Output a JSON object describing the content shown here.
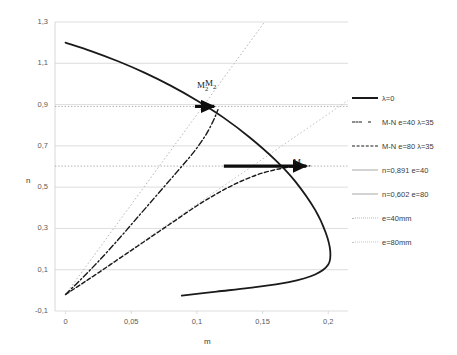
{
  "chart_data": {
    "type": "line",
    "title": "",
    "xlabel": "m",
    "ylabel": "n",
    "xlim": [
      -0.008,
      0.215
    ],
    "ylim": [
      -0.1,
      1.3
    ],
    "grid": true,
    "legend_position": "right",
    "x_ticks": [
      "0",
      "0,05",
      "0,1",
      "0,15",
      "0,2"
    ],
    "x_tick_values": [
      0,
      0.05,
      0.1,
      0.15,
      0.2
    ],
    "y_ticks": [
      "-0,1",
      "0,1",
      "0,3",
      "0,5",
      "0,7",
      "0,9",
      "1,1",
      "1,3"
    ],
    "y_tick_values": [
      -0.1,
      0.1,
      0.3,
      0.5,
      0.7,
      0.9,
      1.1,
      1.3
    ],
    "series": [
      {
        "name": "λ=0",
        "style": "solid",
        "color": "#1a1a1a",
        "width": 1.8,
        "points": [
          [
            0.0,
            1.2
          ],
          [
            0.02,
            1.158
          ],
          [
            0.04,
            1.11
          ],
          [
            0.06,
            1.055
          ],
          [
            0.08,
            0.992
          ],
          [
            0.1,
            0.92
          ],
          [
            0.12,
            0.838
          ],
          [
            0.14,
            0.742
          ],
          [
            0.16,
            0.63
          ],
          [
            0.175,
            0.527
          ],
          [
            0.19,
            0.39
          ],
          [
            0.198,
            0.28
          ],
          [
            0.2015,
            0.19
          ],
          [
            0.2,
            0.125
          ],
          [
            0.19,
            0.077
          ],
          [
            0.17,
            0.04
          ],
          [
            0.14,
            0.012
          ],
          [
            0.115,
            -0.006
          ],
          [
            0.0885,
            -0.026
          ]
        ]
      },
      {
        "name": "M-N e=40 λ=35",
        "style": "dashdot",
        "color": "#1a1a1a",
        "width": 1.4,
        "points": [
          [
            0.0,
            -0.02
          ],
          [
            0.012,
            0.055
          ],
          [
            0.025,
            0.14
          ],
          [
            0.04,
            0.245
          ],
          [
            0.055,
            0.355
          ],
          [
            0.07,
            0.465
          ],
          [
            0.085,
            0.575
          ],
          [
            0.097,
            0.665
          ],
          [
            0.106,
            0.745
          ],
          [
            0.112,
            0.815
          ],
          [
            0.116,
            0.875
          ]
        ]
      },
      {
        "name": "M-N e=80 λ=35",
        "style": "dashed",
        "color": "#1a1a1a",
        "width": 1.4,
        "points": [
          [
            0.0,
            -0.02
          ],
          [
            0.012,
            0.03
          ],
          [
            0.025,
            0.085
          ],
          [
            0.04,
            0.15
          ],
          [
            0.055,
            0.215
          ],
          [
            0.07,
            0.28
          ],
          [
            0.085,
            0.345
          ],
          [
            0.1,
            0.41
          ],
          [
            0.115,
            0.468
          ],
          [
            0.13,
            0.518
          ],
          [
            0.145,
            0.558
          ],
          [
            0.158,
            0.582
          ],
          [
            0.168,
            0.595
          ],
          [
            0.178,
            0.601
          ],
          [
            0.186,
            0.603
          ]
        ]
      },
      {
        "name": "n=0,891 e=40",
        "style": "solid",
        "color": "#9c9c9c",
        "width": 0.8,
        "type": "hline",
        "value": 0.891
      },
      {
        "name": "n=0,602 e=80",
        "style": "solid",
        "color": "#9c9c9c",
        "width": 0.8,
        "type": "hline",
        "value": 0.602
      },
      {
        "name": "e=40mm",
        "style": "dotted",
        "color": "#b8b8b8",
        "width": 1.0,
        "type": "ray",
        "points": [
          [
            0.0,
            -0.02
          ],
          [
            0.1515,
            1.3
          ]
        ]
      },
      {
        "name": "e=80mm",
        "style": "dotted",
        "color": "#c4c4c4",
        "width": 1.0,
        "type": "ray",
        "points": [
          [
            0.0,
            -0.02
          ],
          [
            0.215,
            0.92
          ]
        ]
      }
    ],
    "markers": [
      {
        "name": "M2-upper",
        "label": "M",
        "sub": "2",
        "arrow_from": [
          0.0985,
          0.891
        ],
        "arrow_to": [
          0.1155,
          0.891
        ]
      },
      {
        "name": "M2-upper-duplicate",
        "label": "M",
        "sub": "2",
        "arrow_from": [
          0.0985,
          0.891
        ],
        "arrow_to": [
          0.1155,
          0.891
        ]
      },
      {
        "name": "M2-lower",
        "label": "M",
        "sub": "2",
        "arrow_from": [
          0.1205,
          0.602
        ],
        "arrow_to": [
          0.1855,
          0.602
        ]
      }
    ],
    "annotations": [
      {
        "text": "M",
        "sub": "2",
        "x": 197,
        "y": 80
      },
      {
        "text": "M",
        "sub": "2",
        "x": 205,
        "y": 78
      },
      {
        "text": "M",
        "sub": "2",
        "x": 293,
        "y": 157
      }
    ],
    "legend": [
      {
        "label": "λ=0",
        "style": "solid-thick",
        "color": "#1a1a1a"
      },
      {
        "label": "M-N e=40 λ=35",
        "style": "dashdot",
        "color": "#1a1a1a"
      },
      {
        "label": "M-N e=80 λ=35",
        "style": "dashed",
        "color": "#1a1a1a"
      },
      {
        "label": "n=0,891 e=40",
        "style": "solid-thin",
        "color": "#a8a8a8"
      },
      {
        "label": "n=0,602 e=80",
        "style": "solid-thin",
        "color": "#a8a8a8"
      },
      {
        "label": "e=40mm",
        "style": "dotted",
        "color": "#b8b8b8"
      },
      {
        "label": "e=80mm",
        "style": "dotted",
        "color": "#c4c4c4"
      }
    ]
  },
  "colors": {
    "grid": "#d4d4d4",
    "grid_faint": "#cccccc",
    "axis_text": "#5a5a5a",
    "background": "#ffffff"
  }
}
